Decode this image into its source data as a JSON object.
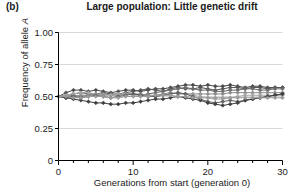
{
  "panel": {
    "label": "(b)"
  },
  "chart_data": {
    "type": "line",
    "title": "Large population: Little genetic drift",
    "xlabel": "Generations from start (generation 0)",
    "ylabel_prefix": "Frequency of allele ",
    "ylabel_italic": "A",
    "ylabel": "Frequency of allele A",
    "xlim": [
      0,
      30
    ],
    "ylim": [
      0,
      1.0
    ],
    "grid": true,
    "legend": "none",
    "x_ticks": [
      0,
      10,
      20,
      30
    ],
    "x_tick_labels": [
      "0",
      "10",
      "20",
      "30"
    ],
    "x_minor_tick_step": 2,
    "y_ticks": [
      0,
      0.25,
      0.5,
      0.75,
      1.0
    ],
    "y_tick_labels": [
      "0",
      "0.25",
      "0.50",
      "0.75",
      "1.00"
    ],
    "marker": "diamond",
    "x": [
      0,
      1,
      2,
      3,
      4,
      5,
      6,
      7,
      8,
      9,
      10,
      11,
      12,
      13,
      14,
      15,
      16,
      17,
      18,
      19,
      20,
      21,
      22,
      23,
      24,
      25,
      26,
      27,
      28,
      29,
      30
    ],
    "series": [
      {
        "name": "population-1",
        "color": "#4a4a4a",
        "values": [
          0.5,
          0.53,
          0.55,
          0.55,
          0.54,
          0.55,
          0.54,
          0.53,
          0.54,
          0.55,
          0.55,
          0.54,
          0.55,
          0.56,
          0.56,
          0.57,
          0.58,
          0.59,
          0.59,
          0.58,
          0.59,
          0.58,
          0.58,
          0.59,
          0.58,
          0.57,
          0.58,
          0.58,
          0.57,
          0.57,
          0.57
        ]
      },
      {
        "name": "population-2",
        "color": "#555555",
        "values": [
          0.5,
          0.51,
          0.52,
          0.53,
          0.52,
          0.52,
          0.53,
          0.52,
          0.52,
          0.53,
          0.54,
          0.55,
          0.56,
          0.55,
          0.54,
          0.56,
          0.57,
          0.56,
          0.56,
          0.57,
          0.56,
          0.55,
          0.56,
          0.57,
          0.57,
          0.56,
          0.57,
          0.57,
          0.56,
          0.57,
          0.57
        ]
      },
      {
        "name": "population-3",
        "color": "#6b6b6b",
        "values": [
          0.5,
          0.5,
          0.51,
          0.5,
          0.51,
          0.52,
          0.51,
          0.52,
          0.51,
          0.52,
          0.52,
          0.51,
          0.52,
          0.53,
          0.54,
          0.55,
          0.56,
          0.57,
          0.56,
          0.55,
          0.55,
          0.54,
          0.54,
          0.55,
          0.55,
          0.56,
          0.56,
          0.55,
          0.55,
          0.56,
          0.56
        ]
      },
      {
        "name": "population-4",
        "color": "#8c8c8c",
        "values": [
          0.5,
          0.5,
          0.5,
          0.51,
          0.51,
          0.52,
          0.52,
          0.51,
          0.51,
          0.52,
          0.52,
          0.52,
          0.51,
          0.51,
          0.52,
          0.53,
          0.52,
          0.52,
          0.52,
          0.52,
          0.52,
          0.52,
          0.52,
          0.53,
          0.53,
          0.53,
          0.53,
          0.53,
          0.53,
          0.53,
          0.53
        ]
      },
      {
        "name": "population-5",
        "color": "#a8a8a8",
        "values": [
          0.5,
          0.51,
          0.52,
          0.53,
          0.53,
          0.52,
          0.51,
          0.51,
          0.52,
          0.52,
          0.51,
          0.51,
          0.5,
          0.5,
          0.51,
          0.52,
          0.53,
          0.52,
          0.51,
          0.5,
          0.49,
          0.48,
          0.48,
          0.49,
          0.5,
          0.51,
          0.51,
          0.51,
          0.51,
          0.51,
          0.51
        ]
      },
      {
        "name": "population-6",
        "color": "#5f5f5f",
        "values": [
          0.5,
          0.49,
          0.5,
          0.49,
          0.5,
          0.51,
          0.5,
          0.49,
          0.5,
          0.51,
          0.52,
          0.51,
          0.5,
          0.5,
          0.51,
          0.52,
          0.53,
          0.52,
          0.5,
          0.48,
          0.46,
          0.45,
          0.46,
          0.47,
          0.46,
          0.47,
          0.48,
          0.49,
          0.5,
          0.51,
          0.52
        ]
      },
      {
        "name": "population-7",
        "color": "#3f3f3f",
        "values": [
          0.5,
          0.49,
          0.48,
          0.47,
          0.46,
          0.45,
          0.45,
          0.44,
          0.44,
          0.45,
          0.45,
          0.46,
          0.47,
          0.48,
          0.48,
          0.49,
          0.5,
          0.49,
          0.48,
          0.47,
          0.45,
          0.44,
          0.43,
          0.44,
          0.45,
          0.47,
          0.48,
          0.49,
          0.5,
          0.51,
          0.52
        ]
      },
      {
        "name": "population-8",
        "color": "#9a9a9a",
        "values": [
          0.5,
          0.5,
          0.49,
          0.49,
          0.5,
          0.5,
          0.5,
          0.49,
          0.49,
          0.5,
          0.5,
          0.5,
          0.5,
          0.51,
          0.51,
          0.51,
          0.5,
          0.5,
          0.49,
          0.49,
          0.49,
          0.49,
          0.49,
          0.49,
          0.49,
          0.49,
          0.49,
          0.49,
          0.49,
          0.49,
          0.49
        ]
      }
    ]
  },
  "style": {
    "axis_color": "#000000",
    "grid_color": "#d9d9d9",
    "text_color": "#1a1a1a",
    "background": "#ffffff"
  }
}
